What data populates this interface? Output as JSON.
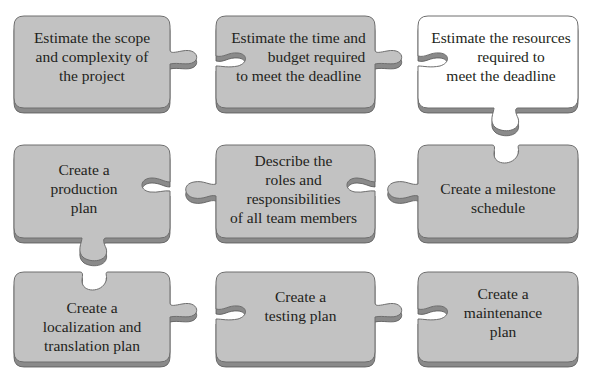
{
  "diagram": {
    "title": "",
    "colors": {
      "piece_fill": "#c2c2c2",
      "piece_fill_highlight": "#ffffff",
      "piece_edge": "#6e6e6e",
      "piece_shadow": "#8a8a8a",
      "text": "#231f20",
      "background": "#ffffff"
    },
    "rows": [
      {
        "pieces": [
          {
            "id": "scope",
            "lines": [
              "Estimate the scope",
              "and complexity of",
              "the project"
            ],
            "highlight": false
          },
          {
            "id": "time-budget",
            "lines": [
              "Estimate the time and",
              "budget required",
              "to meet the deadline"
            ],
            "highlight": false
          },
          {
            "id": "resources",
            "lines": [
              "Estimate the resources",
              "required to",
              "meet the deadline"
            ],
            "highlight": true
          }
        ]
      },
      {
        "pieces": [
          {
            "id": "production-plan",
            "lines": [
              "Create a",
              "production",
              "plan"
            ],
            "highlight": false
          },
          {
            "id": "roles",
            "lines": [
              "Describe the",
              "roles and",
              "responsibilities",
              "of all team members"
            ],
            "highlight": false
          },
          {
            "id": "milestone",
            "lines": [
              "Create a milestone",
              "schedule"
            ],
            "highlight": false
          }
        ]
      },
      {
        "pieces": [
          {
            "id": "localization",
            "lines": [
              "Create a",
              "localization and",
              "translation plan"
            ],
            "highlight": false
          },
          {
            "id": "testing",
            "lines": [
              "Create a",
              "testing plan"
            ],
            "highlight": false
          },
          {
            "id": "maintenance",
            "lines": [
              "Create a",
              "maintenance",
              "plan"
            ],
            "highlight": false
          }
        ]
      }
    ]
  }
}
